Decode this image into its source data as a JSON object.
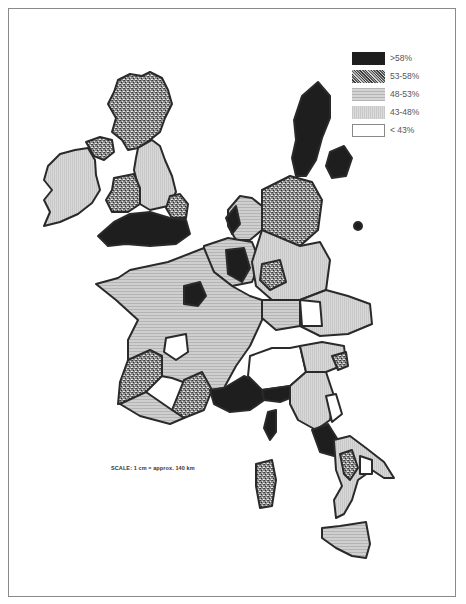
{
  "legend": {
    "items": [
      {
        "label": ">58%",
        "fill": "#1e1e1e",
        "pattern": "solid-black"
      },
      {
        "label": "53-58%",
        "fill": "#7a7a7a",
        "pattern": "speckled"
      },
      {
        "label": "48-53%",
        "fill": "#c4c4c4",
        "pattern": "horizontal-lines"
      },
      {
        "label": "43-48%",
        "fill": "#d4d4d4",
        "pattern": "fine-lines"
      },
      {
        "label": "< 43%",
        "fill": "#ffffff",
        "pattern": "white"
      }
    ]
  },
  "scale": {
    "text": "SCALE: 1 cm = approx. 140 km"
  },
  "colors": {
    "border": "#2a2a2a",
    "frame": "#8a8a8a",
    "background": "#ffffff"
  }
}
